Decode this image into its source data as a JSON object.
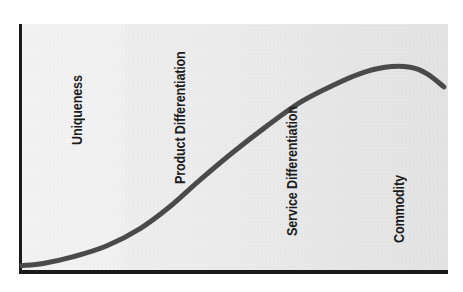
{
  "figure": {
    "background_color": "#ffffff",
    "plot_background_color": "#ececec",
    "axis_color": "#1a1a1a",
    "curve_color": "#4a4a4a",
    "label_color": "#1c1c1c"
  },
  "labels": {
    "uniqueness": "Uniqueness",
    "product_differentiation": "Product Differentiation",
    "service_differentiation": "Service Differentiation",
    "commodity": "Commodity"
  },
  "chart_data": {
    "type": "line",
    "title": "",
    "xlabel": "",
    "ylabel": "",
    "xlim": [
      0,
      100
    ],
    "ylim": [
      0,
      100
    ],
    "grid": false,
    "legend": null,
    "axes": {
      "x_axis_visible": true,
      "y_axis_visible": true,
      "ticks": [],
      "tick_labels": []
    },
    "series": [
      {
        "name": "Value curve",
        "color": "#4a4a4a",
        "line_width": 5,
        "x": [
          0,
          5,
          12,
          20,
          28,
          35,
          42,
          50,
          58,
          66,
          74,
          80,
          86,
          92,
          96,
          100
        ],
        "y": [
          2,
          3,
          6,
          11,
          19,
          29,
          41,
          54,
          66,
          77,
          85,
          90,
          93,
          93,
          90,
          84
        ]
      }
    ],
    "annotations": [
      {
        "text": "Uniqueness",
        "x_band": [
          0,
          25
        ],
        "rotation": 90
      },
      {
        "text": "Product Differentiation",
        "x_band": [
          25,
          50
        ],
        "rotation": 90
      },
      {
        "text": "Service Differentiation",
        "x_band": [
          50,
          76
        ],
        "rotation": 90
      },
      {
        "text": "Commodity",
        "x_band": [
          76,
          100
        ],
        "rotation": 90
      }
    ],
    "background_bands": [
      {
        "label": "Uniqueness",
        "x_range": [
          0,
          25
        ],
        "color": "#f3f3f3"
      },
      {
        "label": "Product Differentiation",
        "x_range": [
          25,
          50
        ],
        "color": "#eeeeee"
      },
      {
        "label": "Service Differentiation",
        "x_range": [
          50,
          76
        ],
        "color": "#e9e9e9"
      },
      {
        "label": "Commodity",
        "x_range": [
          76,
          100
        ],
        "color": "#e4e4e4"
      }
    ]
  }
}
